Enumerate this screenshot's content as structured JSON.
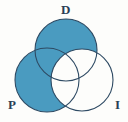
{
  "figure": {
    "name": "venn-diagram",
    "background_color": "#fdfdfb",
    "fill_color": "#4a9bc0",
    "stroke_color": "#2e4a63",
    "label_color": "#2a3f55",
    "empty_color": "#ffffff",
    "stroke_width": 1
  },
  "chart_data": {
    "type": "venn",
    "title": "",
    "sets": [
      {
        "id": "D",
        "label": "D",
        "cx": 66,
        "cy": 50,
        "r": 31,
        "filled": true,
        "label_position": "top"
      },
      {
        "id": "P",
        "label": "P",
        "cx": 47,
        "cy": 80,
        "r": 32,
        "filled": true,
        "label_position": "bottom-left"
      },
      {
        "id": "I",
        "label": "I",
        "cx": 82,
        "cy": 80,
        "r": 31,
        "filled": false,
        "label_position": "bottom-right"
      }
    ],
    "regions": [
      {
        "id": "D-only",
        "members": [
          "D"
        ],
        "shaded": true
      },
      {
        "id": "P-only",
        "members": [
          "P"
        ],
        "shaded": true
      },
      {
        "id": "I-only",
        "members": [
          "I"
        ],
        "shaded": false
      },
      {
        "id": "D-and-P",
        "members": [
          "D",
          "P"
        ],
        "shaded": true
      },
      {
        "id": "D-and-I",
        "members": [
          "D",
          "I"
        ],
        "shaded": false
      },
      {
        "id": "P-and-I",
        "members": [
          "P",
          "I"
        ],
        "shaded": false
      },
      {
        "id": "D-P-I",
        "members": [
          "D",
          "P",
          "I"
        ],
        "shaded": false
      }
    ],
    "shaded_expression": "(D ∪ P) − I",
    "legend": "none",
    "grid": false
  },
  "labels": {
    "d": "D",
    "p": "P",
    "i": "I"
  }
}
